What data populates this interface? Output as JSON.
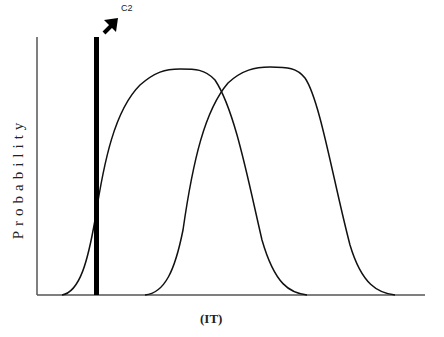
{
  "diagram": {
    "y_axis_label": "Probability",
    "x_axis_label": "(IT)",
    "marker_label": "C2",
    "curves": [
      {
        "name": "distribution-1",
        "start_x": 62,
        "peak_start_x": 160,
        "peak_end_x": 200,
        "end_x": 307
      },
      {
        "name": "distribution-2",
        "start_x": 145,
        "peak_start_x": 250,
        "peak_end_x": 285,
        "end_x": 395
      }
    ],
    "colors": {
      "line": "#111111",
      "axis": "#555555"
    }
  }
}
